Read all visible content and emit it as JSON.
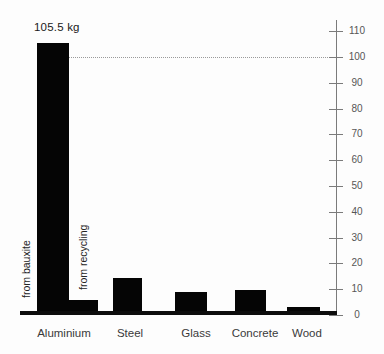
{
  "chart_data": {
    "type": "bar",
    "title": "",
    "unit": "kg",
    "categories": [
      "Aluminium",
      "Steel",
      "Glass",
      "Concrete",
      "Wood"
    ],
    "bars": [
      {
        "id": "aluminium-bauxite",
        "category": "Aluminium",
        "sublabel": "from bauxite",
        "value": 105.5
      },
      {
        "id": "aluminium-recycling",
        "category": "Aluminium",
        "sublabel": "from recycling",
        "value": 6
      },
      {
        "id": "steel",
        "category": "Steel",
        "sublabel": "",
        "value": 14.5
      },
      {
        "id": "glass",
        "category": "Glass",
        "sublabel": "",
        "value": 9
      },
      {
        "id": "concrete",
        "category": "Concrete",
        "sublabel": "",
        "value": 9.5
      },
      {
        "id": "wood",
        "category": "Wood",
        "sublabel": "",
        "value": 3
      }
    ],
    "annotation": "105.5 kg",
    "reference_line": {
      "value": 100,
      "style": "dotted"
    },
    "y_axis": {
      "min": 0,
      "max": 110,
      "tick_step": 10,
      "side": "right",
      "tick_labels": [
        "0",
        "10",
        "20",
        "30",
        "40",
        "50",
        "60",
        "70",
        "80",
        "90",
        "100",
        "110"
      ]
    },
    "grid": false,
    "legend": false,
    "bar_color": "#050505",
    "axis_color": "#7b7b7b"
  }
}
